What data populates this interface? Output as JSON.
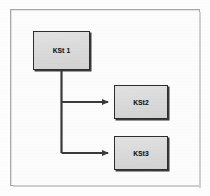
{
  "figure": {
    "title": "",
    "frame_color": "#a8a8a8",
    "background_color": "#fcfcfc"
  },
  "diagram": {
    "type": "flowchart",
    "orientation": "left-to-right branching",
    "node_fill_color": "#dcdcdc",
    "node_border_color": "#2e2e2e",
    "connector_color": "#3a3a3a",
    "nodes": [
      {
        "id": "kst1",
        "label": "KSt 1",
        "role": "parent"
      },
      {
        "id": "kst2",
        "label": "KSt2",
        "role": "child"
      },
      {
        "id": "kst3",
        "label": "KSt3",
        "role": "child"
      }
    ],
    "connectors": [
      {
        "from": "kst1",
        "to": "kst2",
        "style": "elbow",
        "arrowhead": "solid"
      },
      {
        "from": "kst1",
        "to": "kst3",
        "style": "elbow",
        "arrowhead": "solid"
      }
    ]
  }
}
